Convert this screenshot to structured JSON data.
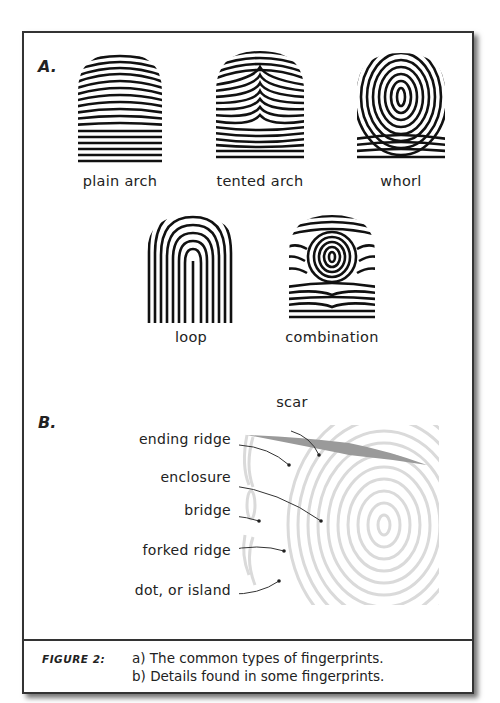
{
  "section_a": {
    "letter": "A.",
    "prints": [
      {
        "label": "plain arch"
      },
      {
        "label": "tented arch"
      },
      {
        "label": "whorl"
      },
      {
        "label": "loop"
      },
      {
        "label": "combination"
      }
    ]
  },
  "section_b": {
    "letter": "B.",
    "scar_label": "scar",
    "details": [
      {
        "label": "ending ridge"
      },
      {
        "label": "enclosure"
      },
      {
        "label": "bridge"
      },
      {
        "label": "forked ridge"
      },
      {
        "label": "dot, or island"
      }
    ]
  },
  "caption": {
    "label": "FIGURE 2:",
    "lines": [
      "a) The common types of fingerprints.",
      "b) Details found in some fingerprints."
    ]
  },
  "colors": {
    "ink": "#222222",
    "faint_ridges": "#d8d8d8",
    "scar": "#9a9a9a",
    "border": "#333333"
  }
}
